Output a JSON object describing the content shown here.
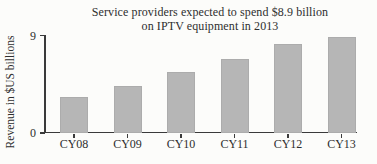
{
  "chart_data": {
    "type": "bar",
    "title": "Service providers expected to spend $8.9 billion on IPTV equipment in 2013",
    "title_lines": [
      "Service providers expected to spend $8.9 billion",
      "on IPTV equipment in 2013"
    ],
    "categories": [
      "CY08",
      "CY09",
      "CY10",
      "CY11",
      "CY12",
      "CY13"
    ],
    "values": [
      3.3,
      4.3,
      5.6,
      6.8,
      8.2,
      8.9
    ],
    "xlabel": "",
    "ylabel": "Revenue in $US billions",
    "ylim": [
      0,
      9
    ],
    "yticks": [
      0,
      9
    ],
    "grid": false,
    "legend": "none",
    "colors": {
      "bar": "#b6b6b6",
      "axis": "#3a3a3a",
      "text": "#2e2e2e",
      "background": "#fcfcfa"
    }
  }
}
